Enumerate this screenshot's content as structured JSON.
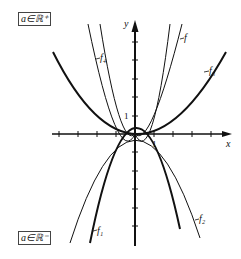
{
  "diagram": {
    "top_tag": "a∈ℝ⁺",
    "bottom_tag": "a∈ℝ⁻",
    "axes": {
      "x_label": "x",
      "y_label": "y",
      "x_unit_label": "1",
      "y_unit_label": "1"
    },
    "curve_labels": {
      "f": "f",
      "f1": "f₁",
      "f2": "f₂",
      "f3": "f₃",
      "f4": "f₄"
    }
  }
}
